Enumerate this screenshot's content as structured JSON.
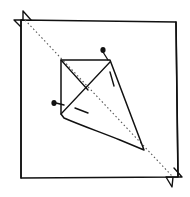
{
  "diagram": {
    "kind": "hand-drawn fold diagram",
    "colors": {
      "ink": "#111111",
      "dashed": "#555555",
      "background": "#ffffff"
    },
    "frame": {
      "label": "square paper outline",
      "points": [
        [
          21,
          20
        ],
        [
          176,
          22
        ],
        [
          178,
          177
        ],
        [
          21,
          178
        ]
      ]
    },
    "diagonal": {
      "label": "dashed diagonal fold line",
      "from": [
        25,
        20
      ],
      "to": [
        173,
        177
      ]
    },
    "kite": {
      "label": "folded kite shape",
      "points": [
        [
          61,
          60
        ],
        [
          110,
          60
        ],
        [
          144,
          150
        ],
        [
          61,
          114
        ]
      ]
    },
    "inner_lines": [
      {
        "label": "crease from top-left corner",
        "from": [
          61,
          60
        ],
        "to": [
          88,
          90
        ]
      },
      {
        "label": "crease from top-right corner",
        "from": [
          110,
          62
        ],
        "to": [
          61,
          114
        ]
      }
    ],
    "pins": [
      {
        "label": "pin top",
        "dot": [
          103,
          50
        ],
        "line_to": [
          110,
          60
        ]
      },
      {
        "label": "pin left",
        "dot": [
          54,
          103
        ],
        "line_to": [
          63,
          105
        ]
      }
    ],
    "short_dashes": [
      {
        "from": [
          110,
          72
        ],
        "to": [
          114,
          86
        ]
      },
      {
        "from": [
          75,
          108
        ],
        "to": [
          88,
          113
        ]
      }
    ],
    "corner_markers": [
      {
        "label": "top-left corner triangle",
        "points": [
          [
            14,
            21
          ],
          [
            24,
            11
          ],
          [
            31,
            22
          ]
        ]
      },
      {
        "label": "bottom-right corner triangle",
        "points": [
          [
            165,
            177
          ],
          [
            177,
            169
          ],
          [
            183,
            178
          ],
          [
            172,
            187
          ]
        ]
      }
    ]
  }
}
